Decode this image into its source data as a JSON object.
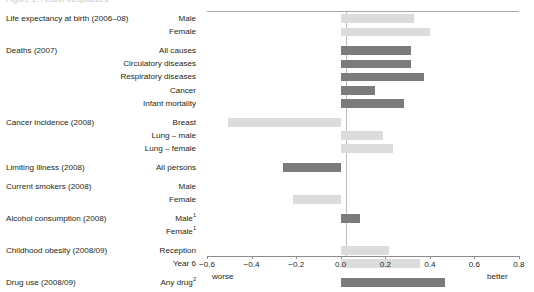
{
  "clipped_title": "Figure 1: Health inequalities",
  "axis": {
    "ticks": [
      -0.6,
      -0.4,
      -0.2,
      0.0,
      0.2,
      0.4,
      0.6,
      0.8
    ],
    "tick_labels": [
      "−0.6",
      "−0.4",
      "−0.2",
      "0.0",
      "0.2",
      "0.4",
      "0.6",
      "0.8"
    ],
    "left_end_label": "worse",
    "right_end_label": "better",
    "min": -0.6,
    "max": 0.8
  },
  "colors": {
    "dark_bar": "#7b7b7b",
    "light_bar": "#dcdcdc",
    "axis": "#8c8c8c",
    "zero_line": "#bdbdbd",
    "text": "#231f20"
  },
  "groups": [
    {
      "category": "Life expectancy at birth (2006–08)",
      "rows": [
        {
          "sub": "Male",
          "value": 0.33,
          "shade": "light"
        },
        {
          "sub": "Female",
          "value": 0.4,
          "shade": "light"
        }
      ]
    },
    {
      "category": "Deaths (2007)",
      "rows": [
        {
          "sub": "All causes",
          "value": 0.315,
          "shade": "dark"
        },
        {
          "sub": "Circulatory diseases",
          "value": 0.315,
          "shade": "dark"
        },
        {
          "sub": "Respiratory diseases",
          "value": 0.375,
          "shade": "dark"
        },
        {
          "sub": "Cancer",
          "value": 0.155,
          "shade": "dark"
        },
        {
          "sub": "Infant mortality",
          "value": 0.285,
          "shade": "dark"
        }
      ]
    },
    {
      "category": "Cancer incidence (2008)",
      "rows": [
        {
          "sub": "Breast",
          "value": -0.505,
          "shade": "light"
        },
        {
          "sub": "Lung – male",
          "value": 0.19,
          "shade": "light"
        },
        {
          "sub": "Lung – female",
          "value": 0.235,
          "shade": "light"
        }
      ]
    },
    {
      "category": "Limiting Illness (2008)",
      "rows": [
        {
          "sub": "All persons",
          "value": -0.26,
          "shade": "dark"
        }
      ]
    },
    {
      "category": "Current smokers (2008)",
      "rows": [
        {
          "sub": "Male",
          "value": 0.0,
          "shade": "light"
        },
        {
          "sub": "Female",
          "value": -0.215,
          "shade": "light"
        }
      ]
    },
    {
      "category": "Alcohol consumption (2008)",
      "rows": [
        {
          "sub": "Male",
          "sup": "1",
          "value": 0.085,
          "shade": "dark"
        },
        {
          "sub": "Female",
          "sup": "1",
          "value": 0.0,
          "shade": "dark"
        }
      ]
    },
    {
      "category": "Childhood obesity (2008/09)",
      "rows": [
        {
          "sub": "Reception",
          "value": 0.215,
          "shade": "light"
        },
        {
          "sub": "Year 6",
          "value": 0.355,
          "shade": "light"
        }
      ]
    },
    {
      "category": "Drug use (2008/09)",
      "rows": [
        {
          "sub": "Any drug",
          "sup": "2",
          "value": 0.47,
          "shade": "dark"
        }
      ]
    }
  ],
  "chart_data": {
    "type": "bar",
    "title": "",
    "xlabel": "",
    "ylabel": "",
    "orientation": "horizontal",
    "xlim": [
      -0.6,
      0.8
    ],
    "xticks": [
      -0.6,
      -0.4,
      -0.2,
      0.0,
      0.2,
      0.4,
      0.6,
      0.8
    ],
    "grid": false,
    "legend": "none",
    "annotations": [
      "worse",
      "better"
    ],
    "categories": [
      "Life expectancy at birth (2006–08) – Male",
      "Life expectancy at birth (2006–08) – Female",
      "Deaths (2007) – All causes",
      "Deaths (2007) – Circulatory diseases",
      "Deaths (2007) – Respiratory diseases",
      "Deaths (2007) – Cancer",
      "Deaths (2007) – Infant mortality",
      "Cancer incidence (2008) – Breast",
      "Cancer incidence (2008) – Lung – male",
      "Cancer incidence (2008) – Lung – female",
      "Limiting Illness (2008) – All persons",
      "Current smokers (2008) – Male",
      "Current smokers (2008) – Female",
      "Alcohol consumption (2008) – Male",
      "Alcohol consumption (2008) – Female",
      "Childhood obesity (2008/09) – Reception",
      "Childhood obesity (2008/09) – Year 6",
      "Drug use (2008/09) – Any drug"
    ],
    "values": [
      0.33,
      0.4,
      0.315,
      0.315,
      0.375,
      0.155,
      0.285,
      -0.505,
      0.19,
      0.235,
      -0.26,
      0.0,
      -0.215,
      0.085,
      0.0,
      0.215,
      0.355,
      0.47
    ]
  }
}
